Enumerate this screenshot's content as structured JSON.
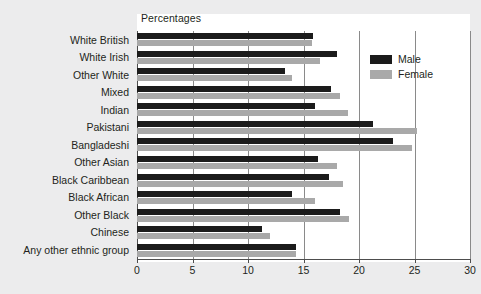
{
  "chart_data": {
    "type": "bar",
    "orientation": "horizontal",
    "title": "Percentages",
    "xlabel": "",
    "ylabel": "",
    "xlim": [
      0,
      30
    ],
    "xticks": [
      0,
      5,
      10,
      15,
      20,
      25,
      30
    ],
    "grid": true,
    "legend_position": "right",
    "categories": [
      "White British",
      "White Irish",
      "Other White",
      "Mixed",
      "Indian",
      "Pakistani",
      "Bangladeshi",
      "Other Asian",
      "Black Caribbean",
      "Black African",
      "Other Black",
      "Chinese",
      "Any other ethnic group"
    ],
    "series": [
      {
        "name": "Male",
        "color": "#1b1b1b",
        "values": [
          15.9,
          18.0,
          13.3,
          17.5,
          16.0,
          21.3,
          23.1,
          16.3,
          17.3,
          14.0,
          18.3,
          11.3,
          14.3
        ]
      },
      {
        "name": "Female",
        "color": "#a9a9a9",
        "values": [
          15.8,
          16.5,
          14.0,
          18.3,
          19.0,
          25.2,
          24.8,
          18.0,
          18.6,
          16.0,
          19.1,
          12.0,
          14.3
        ]
      }
    ]
  },
  "legend": {
    "items": [
      {
        "label": "Male",
        "color": "#1b1b1b"
      },
      {
        "label": "Female",
        "color": "#a9a9a9"
      }
    ]
  }
}
